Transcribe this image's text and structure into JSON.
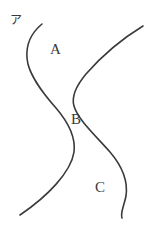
{
  "figure": {
    "tag": "ア",
    "background_color": "#ffffff",
    "stroke_color": "#3a3a3a",
    "stroke_width": 1.6,
    "width": 160,
    "height": 232,
    "labels": [
      {
        "id": "A",
        "text": "A",
        "x": 50,
        "y": 42
      },
      {
        "id": "B",
        "text": "B",
        "x": 71,
        "y": 112
      },
      {
        "id": "C",
        "text": "C",
        "x": 95,
        "y": 180
      }
    ],
    "curves": [
      {
        "name": "left-boundary-curve",
        "path": "M 42 24 C 30 34 26 46 27 58 C 28 74 42 92 56 108 C 68 122 76 136 74 152 C 71 172 48 196 20 215"
      },
      {
        "name": "right-boundary-curve",
        "path": "M 143 26 C 120 40 100 58 86 74 C 76 86 71 96 74 106 C 78 120 96 136 110 152 C 122 166 128 182 126 196 C 124 206 120 213 122 218"
      }
    ]
  }
}
